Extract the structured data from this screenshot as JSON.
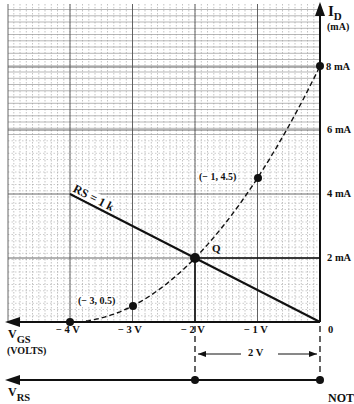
{
  "diagram": {
    "colors": {
      "ink": "#111111",
      "grid_major": "#555555",
      "grid_minor": "#9a9a9a",
      "background": "#ffffff"
    },
    "y_axis": {
      "label": "I",
      "label_sub": "D",
      "units": "(mA)",
      "ticks": [
        "8 mA",
        "6 mA",
        "4 mA",
        "2 mA"
      ],
      "origin_label": "0"
    },
    "x_axis": {
      "label": "V",
      "label_sub": "GS",
      "units": "(VOLTS)",
      "ticks": [
        "− 4 V",
        "− 3 V",
        "− 2 V",
        "− 1 V"
      ]
    },
    "vrs_axis": {
      "label": "V",
      "label_sub": "RS",
      "right_text": "NOT"
    },
    "dimension": {
      "label": "2 V"
    },
    "load_line": {
      "label": "RS = 1 k"
    },
    "q_point": {
      "label": "Q"
    },
    "point_labels": {
      "p1": "(− 1, 4.5)",
      "p2": "(− 3, 0.5)"
    }
  },
  "chart_data": {
    "type": "line",
    "title": "",
    "xlabel": "VGS (VOLTS)",
    "ylabel": "ID (mA)",
    "xlim": [
      -5.0,
      0
    ],
    "ylim": [
      0,
      10
    ],
    "grid": true,
    "series": [
      {
        "name": "Transfer curve (dashed)",
        "style": "dashed",
        "x": [
          -4,
          -3,
          -2,
          -1,
          0
        ],
        "y": [
          0,
          0.5,
          2,
          4.5,
          8
        ]
      },
      {
        "name": "RS = 1 k load line",
        "style": "solid",
        "x": [
          -4,
          0
        ],
        "y": [
          4,
          0
        ]
      }
    ],
    "points": [
      {
        "label": "(-4, 0)",
        "x": -4,
        "y": 0
      },
      {
        "label": "(-3, 0.5)",
        "x": -3,
        "y": 0.5
      },
      {
        "label": "Q",
        "x": -2,
        "y": 2
      },
      {
        "label": "(-1, 4.5)",
        "x": -1,
        "y": 4.5
      },
      {
        "label": "8 mA",
        "x": 0,
        "y": 8
      }
    ],
    "annotations": [
      "RS = 1 k",
      "Q",
      "2 V",
      "VRS",
      "NOT"
    ],
    "x_ticks": [
      "-4 V",
      "-3 V",
      "-2 V",
      "-1 V",
      "0"
    ],
    "y_ticks": [
      "2 mA",
      "4 mA",
      "6 mA",
      "8 mA"
    ]
  }
}
